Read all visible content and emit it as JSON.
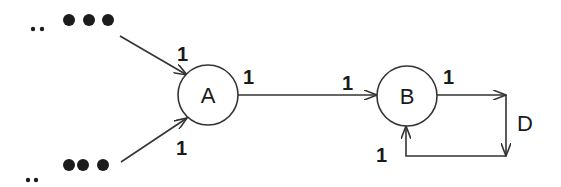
{
  "diagram": {
    "type": "directed-graph",
    "colors": {
      "stroke": "#333333",
      "text": "#1a1a1a",
      "background": "#ffffff"
    },
    "nodes": [
      {
        "id": "A",
        "label": "A"
      },
      {
        "id": "B",
        "label": "B"
      }
    ],
    "loop_label": "D",
    "ellipsis_top": {
      "small_dots": "..",
      "big_dots": "•••"
    },
    "ellipsis_bottom": {
      "small_dots": "..",
      "big_dots": "•••"
    },
    "edges": [
      {
        "from": "ellipsis_top",
        "to": "A",
        "label": "1"
      },
      {
        "from": "ellipsis_bottom",
        "to": "A",
        "label": "1"
      },
      {
        "from": "A",
        "to": "B",
        "tail_label": "1",
        "head_label": "1"
      },
      {
        "from": "B",
        "to": "B",
        "via": "D",
        "tail_label": "1",
        "head_label": "1"
      }
    ]
  }
}
